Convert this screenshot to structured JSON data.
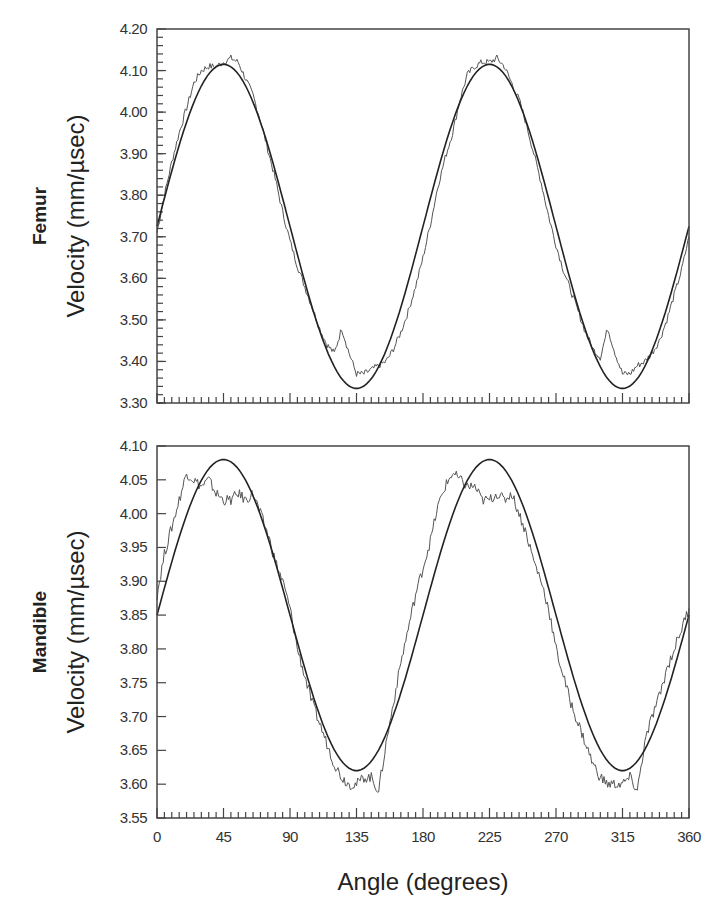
{
  "chart_data": [
    {
      "type": "line",
      "panel": "Femur",
      "title": "Femur",
      "xlabel": "Angle (degrees)",
      "ylabel": "Velocity (mm/µsec)",
      "xlim": [
        0,
        360
      ],
      "ylim": [
        3.3,
        4.2
      ],
      "x_ticks": [
        0,
        45,
        90,
        135,
        180,
        225,
        270,
        315,
        360
      ],
      "y_ticks": [
        "3.30",
        "3.40",
        "3.50",
        "3.60",
        "3.70",
        "3.80",
        "3.90",
        "4.00",
        "4.10",
        "4.20"
      ],
      "grid": false,
      "legend": null,
      "series": [
        {
          "name": "measured",
          "style": "noisy thin line",
          "x": [
            0,
            5,
            10,
            15,
            20,
            25,
            30,
            35,
            40,
            45,
            50,
            55,
            60,
            65,
            70,
            75,
            80,
            85,
            90,
            95,
            100,
            105,
            110,
            115,
            120,
            125,
            130,
            135,
            140,
            145,
            150,
            155,
            160,
            165,
            170,
            175,
            180,
            185,
            190,
            195,
            200,
            205,
            210,
            215,
            220,
            225,
            230,
            235,
            240,
            245,
            250,
            255,
            260,
            265,
            270,
            275,
            280,
            285,
            290,
            295,
            300,
            305,
            310,
            315,
            320,
            325,
            330,
            335,
            340,
            345,
            350,
            355,
            360
          ],
          "values": [
            3.71,
            3.8,
            3.88,
            3.95,
            4.01,
            4.07,
            4.1,
            4.11,
            4.11,
            4.12,
            4.13,
            4.12,
            4.08,
            4.04,
            3.98,
            3.91,
            3.84,
            3.76,
            3.69,
            3.63,
            3.58,
            3.53,
            3.48,
            3.44,
            3.42,
            3.48,
            3.42,
            3.37,
            3.37,
            3.38,
            3.39,
            3.4,
            3.43,
            3.47,
            3.52,
            3.58,
            3.65,
            3.73,
            3.82,
            3.89,
            3.95,
            4.03,
            4.09,
            4.11,
            4.12,
            4.12,
            4.13,
            4.11,
            4.07,
            4.03,
            3.97,
            3.9,
            3.83,
            3.75,
            3.68,
            3.62,
            3.57,
            3.52,
            3.47,
            3.43,
            3.41,
            3.48,
            3.42,
            3.37,
            3.37,
            3.39,
            3.4,
            3.42,
            3.45,
            3.5,
            3.56,
            3.62,
            3.7
          ]
        },
        {
          "name": "sinusoidal fit",
          "style": "smooth thick line",
          "x": [
            0,
            45,
            90,
            135,
            180,
            225,
            270,
            315,
            360
          ],
          "values": [
            3.725,
            4.115,
            3.725,
            3.335,
            3.725,
            4.115,
            3.725,
            3.335,
            3.725
          ]
        }
      ]
    },
    {
      "type": "line",
      "panel": "Mandible",
      "title": "Mandible",
      "xlabel": "Angle (degrees)",
      "ylabel": "Velocity (mm/µsec)",
      "xlim": [
        0,
        360
      ],
      "ylim": [
        3.55,
        4.1
      ],
      "x_ticks": [
        0,
        45,
        90,
        135,
        180,
        225,
        270,
        315,
        360
      ],
      "y_ticks": [
        "3.55",
        "3.60",
        "3.65",
        "3.70",
        "3.75",
        "3.80",
        "3.85",
        "3.90",
        "3.95",
        "4.00",
        "4.05",
        "4.10"
      ],
      "grid": false,
      "legend": null,
      "series": [
        {
          "name": "measured",
          "style": "noisy thin line",
          "x": [
            0,
            5,
            10,
            15,
            20,
            25,
            30,
            35,
            40,
            45,
            50,
            55,
            60,
            65,
            70,
            75,
            80,
            85,
            90,
            95,
            100,
            105,
            110,
            115,
            120,
            125,
            130,
            135,
            140,
            145,
            150,
            155,
            160,
            165,
            170,
            175,
            180,
            185,
            190,
            195,
            200,
            205,
            210,
            215,
            220,
            225,
            230,
            235,
            240,
            245,
            250,
            255,
            260,
            265,
            270,
            275,
            280,
            285,
            290,
            295,
            300,
            305,
            310,
            315,
            320,
            325,
            330,
            335,
            340,
            345,
            350,
            355,
            360
          ],
          "values": [
            3.88,
            3.94,
            3.98,
            4.02,
            4.06,
            4.05,
            4.04,
            4.05,
            4.03,
            4.02,
            4.02,
            4.03,
            4.02,
            4.03,
            4.0,
            3.97,
            3.93,
            3.9,
            3.86,
            3.8,
            3.76,
            3.72,
            3.69,
            3.66,
            3.63,
            3.61,
            3.6,
            3.6,
            3.61,
            3.61,
            3.59,
            3.66,
            3.72,
            3.78,
            3.83,
            3.88,
            3.92,
            3.96,
            4.01,
            4.04,
            4.06,
            4.05,
            4.04,
            4.04,
            4.02,
            4.02,
            4.03,
            4.02,
            4.03,
            4.0,
            3.97,
            3.93,
            3.9,
            3.86,
            3.8,
            3.76,
            3.72,
            3.69,
            3.66,
            3.63,
            3.61,
            3.6,
            3.6,
            3.6,
            3.61,
            3.59,
            3.66,
            3.7,
            3.73,
            3.77,
            3.8,
            3.83,
            3.86
          ]
        },
        {
          "name": "sinusoidal fit",
          "style": "smooth thick line",
          "x": [
            0,
            45,
            90,
            135,
            180,
            225,
            270,
            315,
            360
          ],
          "values": [
            3.85,
            4.08,
            3.85,
            3.62,
            3.85,
            4.08,
            3.85,
            3.62,
            3.85
          ]
        }
      ]
    }
  ],
  "labels": {
    "femur_panel": "Femur",
    "mandible_panel": "Mandible",
    "ylabel": "Velocity (mm/µsec)",
    "xlabel": "Angle (degrees)"
  },
  "colors": {
    "fit_line": "#222222",
    "measured_line": "#555555",
    "frame": "#444444"
  }
}
